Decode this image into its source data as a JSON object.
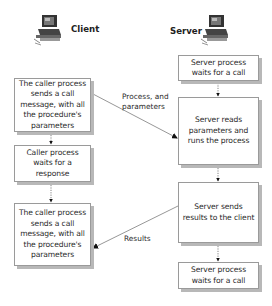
{
  "columns": {
    "client": {
      "label": "Client",
      "icon": "computer-icon"
    },
    "server": {
      "label": "Server",
      "icon": "computer-icon"
    }
  },
  "client_steps": [
    {
      "text": "The caller process sends a call message, with all the procedure's parameters"
    },
    {
      "text": "Caller process waits for a response"
    },
    {
      "text": "The caller process sends a call message, with all the procedure's parameters"
    }
  ],
  "server_steps": [
    {
      "text": "Server process waits for a call"
    },
    {
      "text": "Server reads parameters and runs the process"
    },
    {
      "text": "Server sends results to the client"
    },
    {
      "text": "Server process waits for a call"
    }
  ],
  "messages": [
    {
      "from": "client_steps.0",
      "to": "server_steps.1",
      "label_line1": "Process, and",
      "label_line2": "parameters"
    },
    {
      "from": "server_steps.2",
      "to": "client_steps.2",
      "label": "Results"
    }
  ],
  "colors": {
    "box_border": "#9a9a9a",
    "box_shadow": "#b8b8b8",
    "line": "#6a6a6a",
    "text": "#2a2a2a"
  }
}
